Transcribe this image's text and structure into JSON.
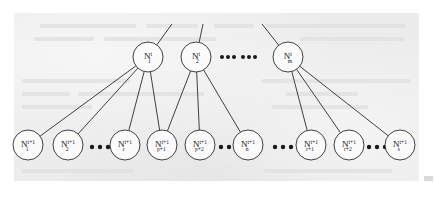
{
  "figure": {
    "type": "hierarchical-node-tree",
    "background_color": "#ececed",
    "page_color": "#ffffff",
    "stroke_color": "#2b2b2e",
    "text_color": "#17171a"
  },
  "levels": {
    "parent_level_superscript": "i",
    "child_level_superscript": "i+1"
  },
  "parent_nodes": [
    {
      "id": "p1",
      "base": "N",
      "sub": "1",
      "sup": "i",
      "cx": 148,
      "cy": 57,
      "r": 15
    },
    {
      "id": "p2",
      "base": "N",
      "sub": "2",
      "sup": "i",
      "cx": 196,
      "cy": 57,
      "r": 15
    },
    {
      "id": "pm",
      "base": "N",
      "sub": "m",
      "sup": "i",
      "cx": 288,
      "cy": 57,
      "r": 15
    }
  ],
  "child_nodes": [
    {
      "id": "c1",
      "base": "N",
      "sub": "1",
      "sup": "i+1",
      "cx": 28,
      "cy": 145,
      "r": 15
    },
    {
      "id": "c2",
      "base": "N",
      "sub": "2",
      "sup": "i+1",
      "cx": 68,
      "cy": 145,
      "r": 15
    },
    {
      "id": "cr",
      "base": "N",
      "sub": "r",
      "sup": "i+1",
      "cx": 125,
      "cy": 145,
      "r": 15
    },
    {
      "id": "cp1",
      "base": "N",
      "sub": "p+1",
      "sup": "i+1",
      "cx": 162,
      "cy": 145,
      "r": 15
    },
    {
      "id": "cp2",
      "base": "N",
      "sub": "p+2",
      "sup": "i+1",
      "cx": 200,
      "cy": 145,
      "r": 15
    },
    {
      "id": "cn",
      "base": "N",
      "sub": "n",
      "sup": "i+1",
      "cx": 248,
      "cy": 145,
      "r": 15
    },
    {
      "id": "cr1",
      "base": "N",
      "sub": "r+1",
      "sup": "i+1",
      "cx": 311,
      "cy": 145,
      "r": 15
    },
    {
      "id": "cr2",
      "base": "N",
      "sub": "r+2",
      "sup": "i+1",
      "cx": 349,
      "cy": 145,
      "r": 15
    },
    {
      "id": "cs",
      "base": "N",
      "sub": "s",
      "sup": "i+1",
      "cx": 400,
      "cy": 145,
      "r": 15
    }
  ],
  "edges": [
    {
      "from": "p1",
      "to": "c1"
    },
    {
      "from": "p1",
      "to": "c2"
    },
    {
      "from": "p1",
      "to": "cr"
    },
    {
      "from": "p1",
      "to": "cp1"
    },
    {
      "from": "p2",
      "to": "cp1"
    },
    {
      "from": "p2",
      "to": "cp2"
    },
    {
      "from": "p2",
      "to": "cn"
    },
    {
      "from": "pm",
      "to": "cr1"
    },
    {
      "from": "pm",
      "to": "cr2"
    },
    {
      "from": "pm",
      "to": "cs"
    }
  ],
  "stub_edges": [
    {
      "from": "p1",
      "x2": 172,
      "y2": 24
    },
    {
      "from": "p2",
      "x2": 203,
      "y2": 24
    },
    {
      "from": "pm",
      "x2": 262,
      "y2": 24
    }
  ],
  "ellipses": [
    {
      "id": "top-gap",
      "row": "parent",
      "cy": 57,
      "dots": [
        222,
        228,
        234,
        243,
        249,
        255
      ],
      "radius": 2.0
    },
    {
      "id": "child-gap-1",
      "row": "child",
      "cy": 147,
      "dots": [
        92,
        100,
        108
      ],
      "radius": 2.2
    },
    {
      "id": "child-gap-2",
      "row": "child",
      "cy": 147,
      "dots": [
        221,
        229,
        237
      ],
      "radius": 2.2
    },
    {
      "id": "child-gap-3",
      "row": "child",
      "cy": 147,
      "dots": [
        275,
        283,
        291
      ],
      "radius": 2.2
    },
    {
      "id": "child-gap-4",
      "row": "child",
      "cy": 147,
      "dots": [
        369,
        377,
        385
      ],
      "radius": 2.2
    }
  ],
  "ghost_text_lines": [
    {
      "x": 40,
      "y": 24,
      "w": 96,
      "h": 4
    },
    {
      "x": 146,
      "y": 24,
      "w": 52,
      "h": 4
    },
    {
      "x": 214,
      "y": 24,
      "w": 40,
      "h": 4
    },
    {
      "x": 266,
      "y": 24,
      "w": 140,
      "h": 4
    },
    {
      "x": 34,
      "y": 37,
      "w": 60,
      "h": 4
    },
    {
      "x": 104,
      "y": 37,
      "w": 112,
      "h": 4
    },
    {
      "x": 300,
      "y": 37,
      "w": 104,
      "h": 4
    },
    {
      "x": 22,
      "y": 79,
      "w": 108,
      "h": 4
    },
    {
      "x": 262,
      "y": 79,
      "w": 148,
      "h": 4
    },
    {
      "x": 22,
      "y": 92,
      "w": 48,
      "h": 4
    },
    {
      "x": 78,
      "y": 92,
      "w": 126,
      "h": 4
    },
    {
      "x": 286,
      "y": 92,
      "w": 72,
      "h": 4
    },
    {
      "x": 22,
      "y": 105,
      "w": 70,
      "h": 4
    },
    {
      "x": 272,
      "y": 105,
      "w": 96,
      "h": 4
    },
    {
      "x": 22,
      "y": 169,
      "w": 112,
      "h": 4
    },
    {
      "x": 264,
      "y": 169,
      "w": 128,
      "h": 4
    }
  ]
}
